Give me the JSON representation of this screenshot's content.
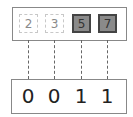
{
  "top_set": {
    "cells": [
      {
        "value": "2",
        "state": "unselected"
      },
      {
        "value": "3",
        "state": "unselected"
      },
      {
        "value": "5",
        "state": "selected"
      },
      {
        "value": "7",
        "state": "selected"
      }
    ]
  },
  "bits": {
    "values": [
      "0",
      "0",
      "1",
      "1"
    ]
  },
  "colors": {
    "selected_fill": "#8a8a8a",
    "selected_border": "#444444",
    "unselected_border": "#c8c8c8",
    "frame": "#888888",
    "connector": "#666666"
  }
}
